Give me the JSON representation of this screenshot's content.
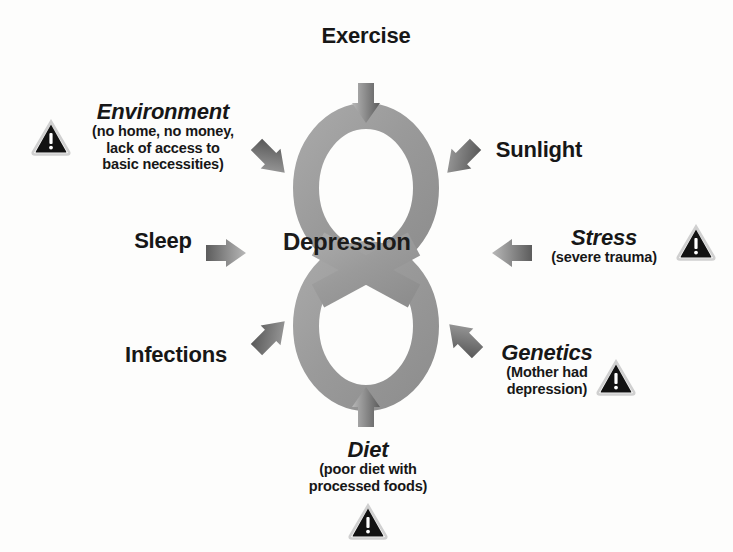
{
  "diagram": {
    "center": {
      "label": "Depression",
      "symbol_name": "infinity-loop",
      "symbol_color": "#9d9d9d"
    },
    "colors": {
      "background": "#fdfdfc",
      "text": "#171717",
      "arrow_dark": "#5f5f5f",
      "arrow_light": "#b5b5b5",
      "warning_fill": "#121212",
      "warning_mark": "#ffffff",
      "warning_border": "#d2d2d2"
    },
    "factors": [
      {
        "id": "exercise",
        "title": "Exercise",
        "sub": "",
        "italic": false,
        "warning": false,
        "arrow": "down"
      },
      {
        "id": "environment",
        "title": "Environment",
        "sub": "(no home, no money,\nlack of access to\nbasic necessities)",
        "italic": true,
        "warning": true,
        "arrow": "down-right"
      },
      {
        "id": "sunlight",
        "title": "Sunlight",
        "sub": "",
        "italic": false,
        "warning": false,
        "arrow": "down-left"
      },
      {
        "id": "sleep",
        "title": "Sleep",
        "sub": "",
        "italic": false,
        "warning": false,
        "arrow": "right"
      },
      {
        "id": "stress",
        "title": "Stress",
        "sub": "(severe trauma)",
        "italic": true,
        "warning": true,
        "arrow": "left"
      },
      {
        "id": "infections",
        "title": "Infections",
        "sub": "",
        "italic": false,
        "warning": false,
        "arrow": "up-right"
      },
      {
        "id": "genetics",
        "title": "Genetics",
        "sub": "(Mother had\ndepression)",
        "italic": true,
        "warning": true,
        "arrow": "up-left"
      },
      {
        "id": "diet",
        "title": "Diet",
        "sub": "(poor diet with\nprocessed foods)",
        "italic": true,
        "warning": true,
        "arrow": "up"
      }
    ]
  }
}
